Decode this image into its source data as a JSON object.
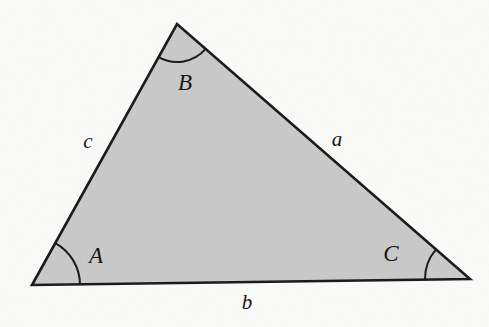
{
  "figure": {
    "kind": "geometry-diagram",
    "canvas": {
      "width": 489,
      "height": 327
    },
    "colors": {
      "background": "#fbfbfa",
      "fill": "#c9c9c9",
      "stroke": "#161616",
      "label": "#111111"
    },
    "stroke_width": 2.6,
    "arc_stroke_width": 2.0
  },
  "vertices": [
    {
      "id": "A",
      "label": "A",
      "x": 32,
      "y": 285,
      "label_x": 96,
      "label_y": 258,
      "arc_radius": 48
    },
    {
      "id": "B",
      "label": "B",
      "x": 177,
      "y": 24,
      "label_x": 185,
      "label_y": 85,
      "arc_radius": 38
    },
    {
      "id": "C",
      "label": "C",
      "x": 470,
      "y": 279,
      "label_x": 391,
      "label_y": 256,
      "arc_radius": 45
    }
  ],
  "sides": [
    {
      "id": "a",
      "label": "a",
      "from": "B",
      "to": "C",
      "label_x": 337,
      "label_y": 141
    },
    {
      "id": "b",
      "label": "b",
      "from": "A",
      "to": "C",
      "label_x": 247,
      "label_y": 304
    },
    {
      "id": "c",
      "label": "c",
      "from": "A",
      "to": "B",
      "label_x": 88,
      "label_y": 143
    }
  ],
  "chart_data": {
    "type": "diagram",
    "title": "",
    "shape": "triangle",
    "points": [
      {
        "name": "A",
        "x": 32,
        "y": 285
      },
      {
        "name": "B",
        "x": 177,
        "y": 24
      },
      {
        "name": "C",
        "x": 470,
        "y": 279
      }
    ],
    "edge_labels": [
      "a",
      "b",
      "c"
    ],
    "angle_labels": [
      "A",
      "B",
      "C"
    ],
    "annotations": [
      "side a is opposite angle A and joins vertices B and C",
      "side b is opposite angle B and joins vertices A and C",
      "side c is opposite angle C and joins vertices A and B"
    ]
  }
}
